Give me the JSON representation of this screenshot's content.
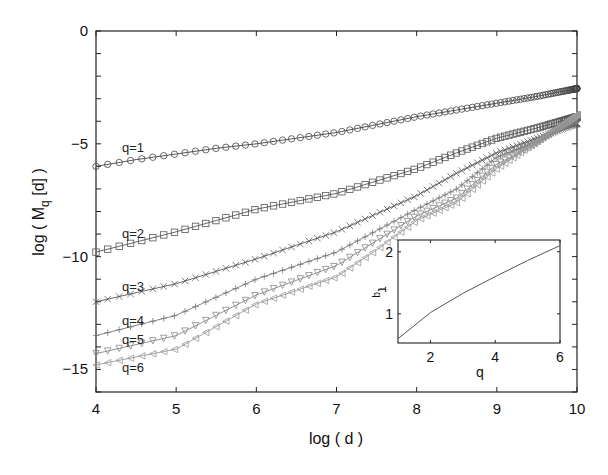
{
  "chart_data": [
    {
      "type": "line",
      "title": "",
      "xlabel": "log ( d )",
      "ylabel": "log ( M_q [d] )",
      "xlim": [
        4,
        10
      ],
      "ylim": [
        -16,
        0
      ],
      "xticks": [
        4,
        5,
        6,
        7,
        8,
        9,
        10
      ],
      "yticks": [
        0,
        -5,
        -10,
        -15
      ],
      "grid": false,
      "legend": "inline labels at left of each series",
      "x": [
        4,
        4.5,
        5,
        5.5,
        6,
        6.5,
        7,
        7.5,
        8,
        8.5,
        9,
        9.5,
        10
      ],
      "series": [
        {
          "name": "q=1",
          "marker": "circle",
          "color": "#444444",
          "values": [
            -6.0,
            -5.7,
            -5.45,
            -5.2,
            -5.0,
            -4.75,
            -4.5,
            -4.15,
            -3.8,
            -3.5,
            -3.2,
            -2.9,
            -2.55
          ]
        },
        {
          "name": "q=2",
          "marker": "square",
          "color": "#555555",
          "values": [
            -9.8,
            -9.35,
            -8.9,
            -8.4,
            -7.9,
            -7.55,
            -7.2,
            -6.65,
            -6.1,
            -5.4,
            -4.75,
            -4.3,
            -3.8
          ]
        },
        {
          "name": "q=3",
          "marker": "x",
          "color": "#555555",
          "values": [
            -12.0,
            -11.6,
            -11.2,
            -10.65,
            -10.1,
            -9.5,
            -8.9,
            -8.1,
            -7.3,
            -6.3,
            -5.4,
            -4.75,
            -4.1
          ]
        },
        {
          "name": "q=4",
          "marker": "plus",
          "color": "#777777",
          "values": [
            -13.5,
            -13.05,
            -12.6,
            -11.8,
            -11.0,
            -10.4,
            -9.8,
            -8.85,
            -7.9,
            -7.0,
            -5.6,
            -4.9,
            -4.0
          ]
        },
        {
          "name": "q=5",
          "marker": "triangle-down",
          "color": "#888888",
          "values": [
            -14.3,
            -13.9,
            -13.5,
            -12.6,
            -11.7,
            -11.05,
            -10.4,
            -9.3,
            -8.2,
            -7.4,
            -5.9,
            -5.0,
            -3.8
          ]
        },
        {
          "name": "q=6",
          "marker": "triangle-left",
          "color": "#999999",
          "values": [
            -14.8,
            -14.45,
            -14.1,
            -13.1,
            -12.1,
            -11.5,
            -10.9,
            -9.7,
            -8.4,
            -7.6,
            -6.1,
            -4.9,
            -3.7
          ]
        }
      ]
    },
    {
      "type": "line",
      "title": "inset",
      "xlabel": "q",
      "ylabel": "τ_q",
      "xlim": [
        1,
        6
      ],
      "ylim": [
        0.53,
        2.19
      ],
      "xticks": [
        2,
        4,
        6
      ],
      "yticks": [
        1,
        2
      ],
      "x": [
        1,
        2,
        3,
        4,
        5,
        6
      ],
      "series": [
        {
          "name": "tau_q",
          "color": "#555555",
          "values": [
            0.6,
            1.02,
            1.33,
            1.6,
            1.86,
            2.1
          ]
        }
      ]
    }
  ],
  "labels": {
    "main_xlabel": "log ( d )",
    "main_ylabel_prefix": "log ( M",
    "main_ylabel_sub": "q",
    "main_ylabel_suffix": " [d] )",
    "inset_xlabel": "q",
    "inset_ylabel_main": "τ",
    "inset_ylabel_sub": "q"
  }
}
